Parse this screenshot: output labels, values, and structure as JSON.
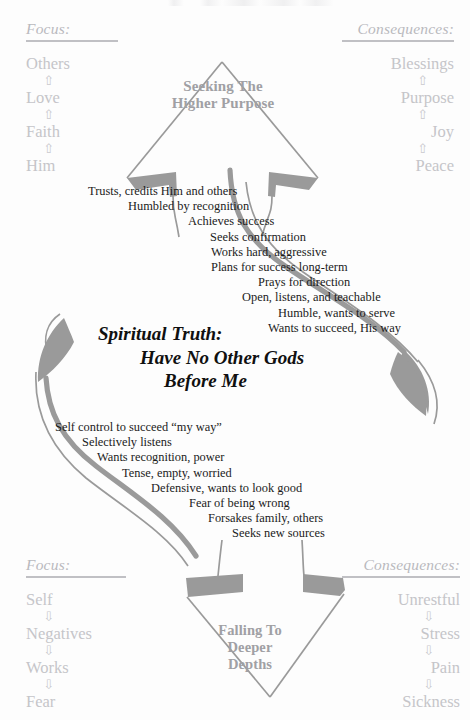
{
  "page": {
    "width": 470,
    "height": 720,
    "background": "#fdfdfd",
    "title": "Spiritual Truth: Have No Other Gods Before Me"
  },
  "colors": {
    "ink": "#1b1b1b",
    "faded_gray": "#c5c5c9",
    "shape_stroke": "#9a9a9a",
    "shape_fill": "#9a9a9a",
    "arrow_label": "#a0a0a4",
    "rule": "#c0c0c4"
  },
  "columns": {
    "focus_top": {
      "heading": "Focus:",
      "arrow_glyph": "⇧",
      "arrow_direction": "up",
      "items": [
        "Others",
        "Love",
        "Faith",
        "Him"
      ]
    },
    "consequences_top": {
      "heading": "Consequences:",
      "arrow_glyph": "⇧",
      "arrow_direction": "up",
      "items": [
        "Blessings",
        "Purpose",
        "Joy",
        "Peace"
      ]
    },
    "focus_bottom": {
      "heading": "Focus:",
      "arrow_glyph": "⇩",
      "arrow_direction": "down",
      "items": [
        "Self",
        "Negatives",
        "Works",
        "Fear"
      ]
    },
    "consequences_bottom": {
      "heading": "Consequences:",
      "arrow_glyph": "⇩",
      "arrow_direction": "down",
      "items": [
        "Unrestful",
        "Stress",
        "Pain",
        "Sickness"
      ]
    }
  },
  "arrow_labels": {
    "top": [
      "Seeking The",
      "Higher Purpose"
    ],
    "bottom": [
      "Falling To",
      "Deeper",
      "Depths"
    ]
  },
  "center_statement": {
    "line1": "Spiritual Truth:",
    "line2": "Have No Other Gods",
    "line3": "Before Me"
  },
  "cascade_upward": {
    "lines": [
      {
        "text": "Trusts, credits Him and others",
        "indent": 88
      },
      {
        "text": "Humbled by recognition",
        "indent": 128
      },
      {
        "text": "Achieves success",
        "indent": 188
      },
      {
        "text": "Seeks confirmation",
        "indent": 210
      },
      {
        "text": "Works hard, aggressive",
        "indent": 211
      },
      {
        "text": "Plans for success long-term",
        "indent": 211
      },
      {
        "text": "Prays for direction",
        "indent": 258
      },
      {
        "text": "Open, listens, and teachable",
        "indent": 242
      },
      {
        "text": "Humble, wants to serve",
        "indent": 278
      },
      {
        "text": "Wants to succeed, His way",
        "indent": 268
      }
    ]
  },
  "cascade_downward": {
    "lines": [
      {
        "text": "Self control to succeed “my way”",
        "indent": 55
      },
      {
        "text": "Selectively listens",
        "indent": 82
      },
      {
        "text": "Wants recognition, power",
        "indent": 97
      },
      {
        "text": "Tense, empty, worried",
        "indent": 122
      },
      {
        "text": "Defensive, wants to look good",
        "indent": 151
      },
      {
        "text": "Fear of being wrong",
        "indent": 189
      },
      {
        "text": "Forsakes family, others",
        "indent": 208
      },
      {
        "text": "Seeks new sources",
        "indent": 232
      }
    ]
  },
  "shapes": {
    "top_arrowhead": "upward-chevron-arrowhead",
    "bottom_arrowhead": "downward-chevron-arrowhead",
    "connector": "vertical-s-curve-double-band",
    "left_crescent": "crescent-arrow-left",
    "right_crescent": "crescent-arrow-right"
  },
  "scan_artifact": {
    "present": true,
    "description": "faint clipped text strip at top edge"
  }
}
